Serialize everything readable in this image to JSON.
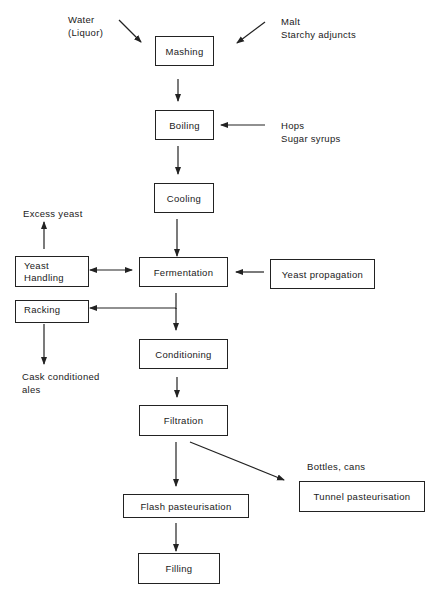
{
  "diagram": {
    "steps": {
      "mashing": "Mashing",
      "boiling": "Boiling",
      "cooling": "Cooling",
      "fermentation": "Fermentation",
      "yeast_handling": "Yeast\nHandling",
      "yeast_propagation": "Yeast propagation",
      "racking": "Racking",
      "conditioning": "Conditioning",
      "filtration": "Filtration",
      "flash_pasteurisation": "Flash pasteurisation",
      "tunnel_pasteurisation": "Tunnel pasteurisation",
      "filling": "Filling"
    },
    "inputs": {
      "water": "Water\n(Liquor)",
      "malt": "Malt\nStarchy adjuncts",
      "hops": "Hops\nSugar syrups"
    },
    "outputs": {
      "excess_yeast": "Excess yeast",
      "cask_ales": "Cask conditioned\nales",
      "bottles_cans": "Bottles, cans"
    },
    "edges": [
      {
        "from": "Water (Liquor)",
        "to": "Mashing"
      },
      {
        "from": "Malt / Starchy adjuncts",
        "to": "Mashing"
      },
      {
        "from": "Mashing",
        "to": "Boiling"
      },
      {
        "from": "Hops / Sugar syrups",
        "to": "Boiling"
      },
      {
        "from": "Boiling",
        "to": "Cooling"
      },
      {
        "from": "Cooling",
        "to": "Fermentation"
      },
      {
        "from": "Yeast propagation",
        "to": "Fermentation"
      },
      {
        "from": "Fermentation",
        "to": "Yeast Handling",
        "bidirectional": true
      },
      {
        "from": "Yeast Handling",
        "to": "Excess yeast"
      },
      {
        "from": "Fermentation",
        "to": "Racking"
      },
      {
        "from": "Racking",
        "to": "Cask conditioned ales"
      },
      {
        "from": "Fermentation",
        "to": "Conditioning"
      },
      {
        "from": "Conditioning",
        "to": "Filtration"
      },
      {
        "from": "Filtration",
        "to": "Flash pasteurisation"
      },
      {
        "from": "Filtration",
        "to": "Tunnel pasteurisation"
      },
      {
        "from": "Flash pasteurisation",
        "to": "Filling"
      }
    ]
  }
}
